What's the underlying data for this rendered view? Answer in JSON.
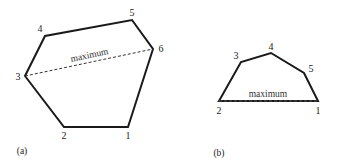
{
  "figure_a": {
    "caption": "(a)",
    "max_label": "maximum",
    "vertices": [
      {
        "id": "1",
        "label": "1"
      },
      {
        "id": "2",
        "label": "2"
      },
      {
        "id": "3",
        "label": "3"
      },
      {
        "id": "4",
        "label": "4"
      },
      {
        "id": "5",
        "label": "5"
      },
      {
        "id": "6",
        "label": "6"
      }
    ]
  },
  "figure_b": {
    "caption": "(b)",
    "max_label": "maximum",
    "vertices": [
      {
        "id": "1",
        "label": "1"
      },
      {
        "id": "2",
        "label": "2"
      },
      {
        "id": "3",
        "label": "3"
      },
      {
        "id": "4",
        "label": "4"
      },
      {
        "id": "5",
        "label": "5"
      }
    ]
  },
  "colors": {
    "stroke": "#1a1a1a",
    "text": "#222222"
  }
}
